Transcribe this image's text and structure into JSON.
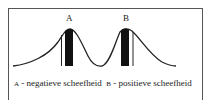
{
  "diagram": {
    "peak_a_label": "A",
    "peak_b_label": "B",
    "caption": {
      "a_key": "A",
      "a_text": " - negatieve scheefheid",
      "b_key": "B",
      "b_text": " - positieve scheefheid"
    },
    "colors": {
      "line": "#222222",
      "fill": "#111111",
      "frame": "#555555"
    }
  }
}
